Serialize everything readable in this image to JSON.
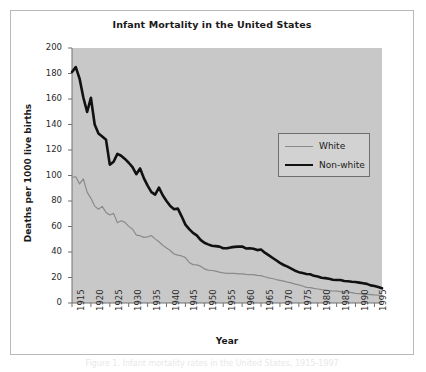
{
  "figure": {
    "background_color": "#ffffff",
    "frame_border_color": "#b8b8b8",
    "caption_partial": "Figure 1. Infant mortality rates in the United States, 1915-1997"
  },
  "chart_data": {
    "type": "line",
    "title": "Infant Mortality in the United States",
    "xlabel": "Year",
    "ylabel": "Deaths per 1000 live births",
    "xlim": [
      1915,
      1997
    ],
    "ylim": [
      0,
      200
    ],
    "yticks": [
      0,
      20,
      40,
      60,
      80,
      100,
      120,
      140,
      160,
      180,
      200
    ],
    "xticks": [
      1915,
      1920,
      1925,
      1930,
      1935,
      1940,
      1945,
      1950,
      1955,
      1960,
      1965,
      1970,
      1975,
      1980,
      1985,
      1990,
      1995
    ],
    "grid": false,
    "plot_background": "#c8c8c8",
    "legend_position": "upper right",
    "legend_entries": [
      "White",
      "Non-white"
    ],
    "x": [
      1915,
      1916,
      1917,
      1918,
      1919,
      1920,
      1921,
      1922,
      1923,
      1924,
      1925,
      1926,
      1927,
      1928,
      1929,
      1930,
      1931,
      1932,
      1933,
      1934,
      1935,
      1936,
      1937,
      1938,
      1939,
      1940,
      1941,
      1942,
      1943,
      1944,
      1945,
      1946,
      1947,
      1948,
      1949,
      1950,
      1951,
      1952,
      1953,
      1954,
      1955,
      1956,
      1957,
      1958,
      1959,
      1960,
      1961,
      1962,
      1963,
      1964,
      1965,
      1966,
      1967,
      1968,
      1969,
      1970,
      1971,
      1972,
      1973,
      1974,
      1975,
      1976,
      1977,
      1978,
      1979,
      1980,
      1981,
      1982,
      1983,
      1984,
      1985,
      1986,
      1987,
      1988,
      1989,
      1990,
      1991,
      1992,
      1993,
      1994,
      1995,
      1996,
      1997
    ],
    "series": [
      {
        "name": "White",
        "color": "#8a8a8a",
        "line_width": 1.2,
        "values": [
          98.6,
          99.0,
          93.4,
          97.4,
          87.0,
          82.1,
          76.0,
          73.6,
          75.8,
          71.0,
          69.0,
          70.3,
          63.0,
          64.5,
          63.2,
          60.1,
          58.0,
          53.3,
          52.8,
          51.5,
          51.9,
          52.9,
          50.3,
          48.0,
          45.3,
          43.2,
          41.2,
          38.4,
          37.5,
          36.9,
          35.6,
          31.8,
          30.1,
          29.9,
          28.9,
          26.8,
          25.8,
          25.5,
          25.0,
          24.2,
          23.6,
          23.2,
          23.3,
          23.2,
          22.9,
          22.9,
          22.4,
          22.3,
          22.2,
          21.6,
          21.5,
          20.6,
          19.7,
          19.2,
          18.4,
          17.8,
          17.1,
          16.4,
          15.8,
          14.8,
          14.2,
          13.3,
          12.3,
          12.0,
          11.4,
          11.0,
          10.5,
          10.1,
          9.7,
          9.4,
          9.3,
          8.9,
          8.6,
          8.5,
          8.2,
          7.6,
          7.3,
          6.9,
          6.8,
          6.6,
          6.3,
          6.1,
          6.0
        ]
      },
      {
        "name": "Non-white",
        "color": "#111111",
        "line_width": 2.6,
        "values": [
          181.2,
          185.0,
          176.0,
          161.2,
          149.8,
          161.0,
          140.0,
          133.0,
          130.5,
          128.0,
          108.5,
          110.8,
          117.0,
          115.5,
          113.0,
          110.0,
          106.5,
          101.0,
          105.5,
          98.0,
          92.0,
          87.0,
          85.0,
          90.5,
          84.5,
          80.0,
          76.0,
          73.5,
          74.0,
          68.0,
          61.5,
          58.0,
          55.0,
          53.0,
          49.5,
          47.3,
          46.0,
          44.9,
          44.6,
          44.2,
          43.0,
          43.0,
          43.6,
          44.0,
          44.2,
          44.3,
          42.8,
          42.9,
          42.5,
          41.5,
          41.9,
          39.5,
          37.5,
          35.5,
          33.5,
          31.5,
          29.8,
          28.5,
          27.0,
          25.3,
          24.2,
          23.5,
          22.8,
          22.5,
          21.3,
          20.8,
          19.8,
          19.5,
          19.0,
          18.3,
          18.0,
          18.0,
          17.2,
          17.0,
          16.7,
          16.5,
          16.0,
          15.5,
          15.0,
          13.8,
          13.3,
          12.5,
          11.5
        ]
      }
    ]
  }
}
